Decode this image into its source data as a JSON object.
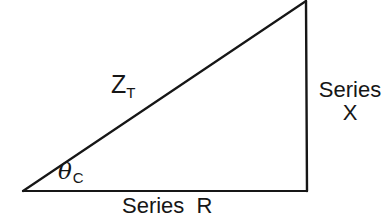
{
  "figure": {
    "type": "line-diagram",
    "background_color": "#ffffff",
    "stroke_color": "#161616",
    "canvas": {
      "width": 387,
      "height": 220
    }
  },
  "geometry": {
    "vertices": {
      "left": {
        "x": 23,
        "y": 191
      },
      "bottom_right": {
        "x": 307,
        "y": 191
      },
      "apex": {
        "x": 306,
        "y": 1
      }
    },
    "sides": {
      "base": {
        "name": "horizontal-leg",
        "from": "left",
        "to": "bottom_right"
      },
      "vertical": {
        "name": "vertical-leg",
        "from": "bottom_right",
        "to": "apex"
      },
      "hypotenuse": {
        "name": "hypotenuse",
        "from": "left",
        "to": "apex"
      }
    },
    "stroke_width": 2
  },
  "labels": {
    "hypotenuse": {
      "symbol": "Z",
      "subscript": "T"
    },
    "angle": {
      "symbol": "θ",
      "subscript": "C"
    },
    "vertical_leg": {
      "line1": "Series",
      "line2": "X"
    },
    "base_leg": {
      "text": "Series  R"
    }
  }
}
